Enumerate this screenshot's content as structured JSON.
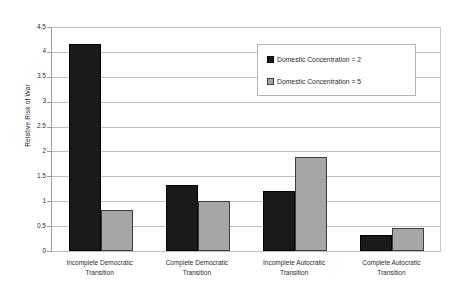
{
  "chart_data": {
    "type": "bar",
    "title": "",
    "xlabel": "",
    "ylabel": "Relative Risk of War",
    "ylim": [
      0,
      4.5
    ],
    "yticks": [
      "0",
      "0.5",
      "1",
      "1.5",
      "2",
      "2.5",
      "3",
      "3.5",
      "4",
      "4.5"
    ],
    "ytick_values": [
      0,
      0.5,
      1,
      1.5,
      2,
      2.5,
      3,
      3.5,
      4,
      4.5
    ],
    "grid": true,
    "legend_position": "upper-right",
    "categories": [
      "Incomplete Democratic Transition",
      "Complete Democratic Transition",
      "Incomplete Autocratic Transition",
      "Complete Autocratic Transition"
    ],
    "category_lines": [
      [
        "Incomplete Democratic",
        "Transition"
      ],
      [
        "Complete Democratic",
        "Transition"
      ],
      [
        "Incomplete Autocratic",
        "Transition"
      ],
      [
        "Complete Autocratic",
        "Transition"
      ]
    ],
    "series": [
      {
        "name": "Domestic Concentration = 2",
        "color": "#1a1a1a",
        "values": [
          4.16,
          1.33,
          1.21,
          0.32
        ]
      },
      {
        "name": "Domestic Concentration = 5",
        "color": "#a6a6a6",
        "values": [
          0.82,
          1.0,
          1.88,
          0.47
        ]
      }
    ]
  },
  "legend": {
    "items": [
      {
        "label": "Domestic Concentration = 2"
      },
      {
        "label": "Domestic Concentration = 5"
      }
    ]
  }
}
